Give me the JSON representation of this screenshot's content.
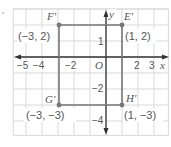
{
  "figure": {
    "title": "",
    "grid": {
      "xmin": -5.8,
      "xmax": 3.9,
      "ymin": -4.9,
      "ymax": 3.0,
      "step": 1,
      "color": "#d9d9d9"
    },
    "axes": {
      "x_label": "x",
      "y_label": "y",
      "origin_label": "O",
      "x_ticks": [
        {
          "value": -5,
          "label": "−5"
        },
        {
          "value": -4,
          "label": "−4"
        },
        {
          "value": -2,
          "label": "−2"
        },
        {
          "value": 2,
          "label": "2"
        },
        {
          "value": 3,
          "label": "3"
        }
      ],
      "y_ticks": [
        {
          "value": 1,
          "label": "1"
        },
        {
          "value": -2,
          "label": "−2"
        },
        {
          "value": -4,
          "label": "−4"
        }
      ],
      "color": "#333333"
    },
    "rectangle": {
      "color": "#777777",
      "vertices": [
        {
          "name": "E′",
          "coord_label": "(1, 2)",
          "x": 1,
          "y": 2
        },
        {
          "name": "F′",
          "coord_label": "(−3, 2)",
          "x": -3,
          "y": 2
        },
        {
          "name": "G′",
          "coord_label": "(−3, −3)",
          "x": -3,
          "y": -3
        },
        {
          "name": "H′",
          "coord_label": "(1, −3)",
          "x": 1,
          "y": -3
        }
      ]
    }
  }
}
